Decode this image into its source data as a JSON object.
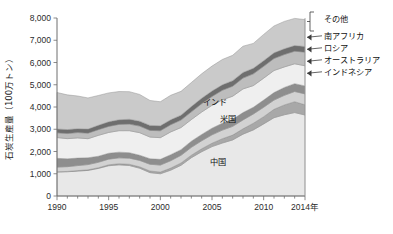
{
  "chart_data": {
    "type": "area",
    "title": "",
    "xlabel": "",
    "ylabel": "石炭生産量（100万トン）",
    "x_unit_suffix": "年",
    "xlim": [
      1990,
      2014
    ],
    "ylim": [
      0,
      8000
    ],
    "ytick_labels": [
      "0",
      "1,000",
      "2,000",
      "3,000",
      "4,000",
      "5,000",
      "6,000",
      "7,000",
      "8,000"
    ],
    "ytick_values": [
      0,
      1000,
      2000,
      3000,
      4000,
      5000,
      6000,
      7000,
      8000
    ],
    "xtick_labels": [
      "1990",
      "1995",
      "2000",
      "2005",
      "2010",
      "2014年"
    ],
    "xtick_values": [
      1990,
      1995,
      2000,
      2005,
      2010,
      2014
    ],
    "minor_xticks": [
      1991,
      1992,
      1993,
      1994,
      1996,
      1997,
      1998,
      1999,
      2001,
      2002,
      2003,
      2004,
      2006,
      2007,
      2008,
      2009,
      2011,
      2012,
      2013
    ],
    "grid": false,
    "legend_position": "right-inline",
    "stacked": true,
    "x": [
      1990,
      1991,
      1992,
      1993,
      1994,
      1995,
      1996,
      1997,
      1998,
      1999,
      2000,
      2001,
      2002,
      2003,
      2004,
      2005,
      2006,
      2007,
      2008,
      2009,
      2010,
      2011,
      2012,
      2013,
      2014
    ],
    "series": [
      {
        "name": "中国",
        "color": "#e8e8e8",
        "values": [
          1080,
          1090,
          1120,
          1150,
          1240,
          1360,
          1400,
          1370,
          1250,
          1050,
          1000,
          1160,
          1380,
          1720,
          1990,
          2220,
          2380,
          2520,
          2780,
          2970,
          3240,
          3520,
          3650,
          3750,
          3640
        ]
      },
      {
        "name": "インドネシア",
        "color": "#a8a8a8",
        "values": [
          10,
          14,
          22,
          27,
          31,
          42,
          50,
          55,
          61,
          74,
          77,
          93,
          103,
          114,
          132,
          152,
          195,
          217,
          240,
          301,
          325,
          376,
          443,
          488,
          458
        ]
      },
      {
        "name": "オーストラリア",
        "color": "#d2d2d2",
        "values": [
          208,
          215,
          225,
          235,
          245,
          255,
          264,
          277,
          289,
          302,
          313,
          333,
          345,
          352,
          360,
          378,
          386,
          393,
          400,
          415,
          424,
          415,
          431,
          459,
          491
        ]
      },
      {
        "name": "ロシア",
        "color": "#8e8e8e",
        "values": [
          395,
          353,
          337,
          306,
          271,
          263,
          257,
          244,
          232,
          249,
          258,
          269,
          256,
          277,
          283,
          299,
          310,
          314,
          329,
          301,
          323,
          336,
          355,
          352,
          358
        ]
      },
      {
        "name": "米国",
        "color": "#efefef",
        "values": [
          934,
          906,
          907,
          857,
          938,
          937,
          964,
          990,
          1014,
          974,
          974,
          1024,
          993,
          972,
          1009,
          1027,
          1053,
          1040,
          1063,
          975,
          984,
          993,
          922,
          893,
          906
        ]
      },
      {
        "name": "インド",
        "color": "#bdbdbd",
        "values": [
          211,
          229,
          240,
          250,
          257,
          271,
          284,
          295,
          296,
          300,
          310,
          323,
          337,
          346,
          376,
          398,
          427,
          452,
          489,
          527,
          532,
          540,
          557,
          565,
          613
        ]
      },
      {
        "name": "南アフリカ",
        "color": "#6e6e6e",
        "values": [
          175,
          178,
          174,
          183,
          196,
          206,
          206,
          219,
          222,
          224,
          224,
          224,
          220,
          238,
          243,
          245,
          245,
          248,
          252,
          250,
          255,
          253,
          259,
          256,
          253
        ]
      },
      {
        "name": "その他",
        "color": "#cacaca",
        "values": [
          1640,
          1560,
          1470,
          1400,
          1340,
          1300,
          1270,
          1240,
          1200,
          1120,
          1080,
          1100,
          1070,
          1080,
          1100,
          1120,
          1140,
          1140,
          1180,
          1120,
          1180,
          1210,
          1230,
          1220,
          1210
        ]
      }
    ],
    "inner_labels": [
      {
        "text": "インド",
        "x": 215,
        "y": 105
      },
      {
        "text": "米国",
        "x": 228,
        "y": 122
      },
      {
        "text": "中国",
        "x": 218,
        "y": 165
      }
    ],
    "legend_entries": [
      {
        "label": "その他",
        "bracket": true,
        "y": 22
      },
      {
        "label": "南アフリカ",
        "bracket": false,
        "y": 39
      },
      {
        "label": "ロシア",
        "bracket": false,
        "y": 51
      },
      {
        "label": "オーストラリア",
        "bracket": false,
        "y": 63
      },
      {
        "label": "インドネシア",
        "bracket": false,
        "y": 75
      }
    ]
  },
  "caption": {
    "text": ""
  }
}
